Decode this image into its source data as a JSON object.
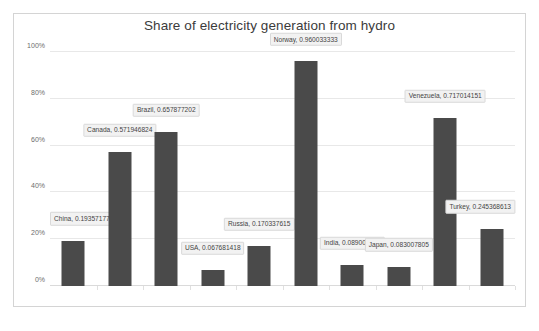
{
  "chart": {
    "title": "Share of electricity generation from hydro",
    "frame_border_color": "#d4d4d4",
    "bar_color": "#4a4a4a",
    "gridline_color": "#e8e8e8",
    "label_box_color": "#f2f2f2"
  },
  "yaxis": {
    "ticks": [
      "100%",
      "80%",
      "60%",
      "40%",
      "20%",
      "0%"
    ]
  },
  "chart_data": {
    "type": "bar",
    "title": "Share of electricity generation from hydro",
    "xlabel": "",
    "ylabel": "",
    "ylim": [
      0,
      1.0
    ],
    "yticks": [
      0,
      0.2,
      0.4,
      0.6,
      0.8,
      1.0
    ],
    "ytick_labels": [
      "0%",
      "20%",
      "40%",
      "60%",
      "80%",
      "100%"
    ],
    "grid": true,
    "legend": "none",
    "categories": [
      "China",
      "Canada",
      "Brazil",
      "USA",
      "Russia",
      "Norway",
      "India",
      "Japan",
      "Venezuela",
      "Turkey"
    ],
    "values": [
      0.193571776,
      0.571946824,
      0.657877202,
      0.067681418,
      0.170337615,
      0.960033333,
      0.089009296,
      0.083007805,
      0.717014151,
      0.245368613
    ],
    "data_labels": [
      "China, 0.193571776",
      "Canada, 0.571946824",
      "Brazil, 0.657877202",
      "USA, 0.067681418",
      "Russia, 0.170337615",
      "Norway, 0.960033333",
      "India, 0.089009296",
      "Japan, 0.083007805",
      "Venezuela, 0.717014151",
      "Turkey, 0.245368613"
    ]
  }
}
